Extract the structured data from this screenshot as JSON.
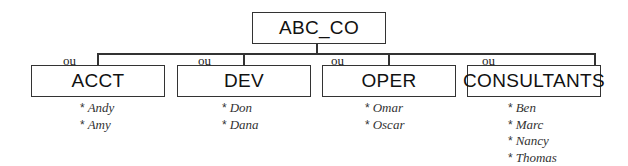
{
  "root": {
    "label": "ABC_CO"
  },
  "connector_label": "ou",
  "departments": [
    {
      "label": "ACCT",
      "relation": "ou",
      "members": [
        "Andy",
        "Amy"
      ]
    },
    {
      "label": "DEV",
      "relation": "ou",
      "members": [
        "Don",
        "Dana"
      ]
    },
    {
      "label": "OPER",
      "relation": "ou",
      "members": [
        "Omar",
        "Oscar"
      ]
    },
    {
      "label": "CONSULTANTS",
      "relation": "ou",
      "members": [
        "Ben",
        "Marc",
        "Nancy",
        "Thomas"
      ]
    }
  ],
  "bullet": "*",
  "colors": {
    "line": "#333333",
    "text": "#111111",
    "background": "#ffffff"
  }
}
